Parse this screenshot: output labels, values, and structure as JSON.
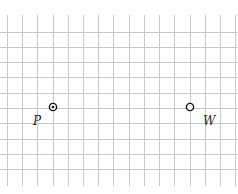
{
  "grid": {
    "color": "#c8c8c8",
    "vertical_x": [
      7,
      22,
      37,
      53,
      68,
      83,
      98,
      113,
      129,
      144,
      159,
      174,
      190,
      205,
      220,
      235
    ],
    "horizontal_y": [
      32,
      47,
      62,
      77,
      93,
      108,
      123,
      139,
      154,
      169
    ],
    "v_top": 15,
    "v_bottom": 186,
    "h_left": 0,
    "h_right": 238
  },
  "points": [
    {
      "id": "P",
      "label": "P",
      "x": 53,
      "y": 107,
      "style": "dot-in-circle",
      "label_x": 33,
      "label_y": 114
    },
    {
      "id": "W",
      "label": "W",
      "x": 190,
      "y": 107,
      "style": "open-circle",
      "label_x": 203,
      "label_y": 114
    }
  ]
}
